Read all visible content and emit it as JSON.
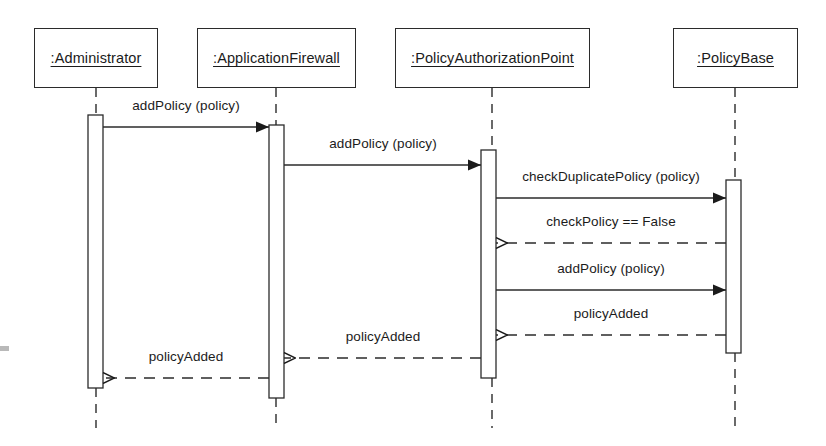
{
  "diagram": {
    "type": "uml-sequence-diagram",
    "width": 826,
    "height": 446,
    "background_color": "#ffffff",
    "line_color": "#2b2b2b",
    "text_color": "#1b1b1b"
  },
  "lifelines": [
    {
      "id": "administrator",
      "label": ":Administrator",
      "box": {
        "x": 34,
        "y": 28,
        "w": 124,
        "h": 60
      },
      "center_x": 96,
      "activation": {
        "x": 88,
        "y": 115,
        "w": 15,
        "h": 273
      },
      "lifeline_bottom": 428
    },
    {
      "id": "application-firewall",
      "label": ":ApplicationFirewall",
      "box": {
        "x": 197,
        "y": 28,
        "w": 159,
        "h": 60
      },
      "center_x": 276,
      "activation": {
        "x": 269,
        "y": 125,
        "w": 15,
        "h": 273
      },
      "lifeline_bottom": 428
    },
    {
      "id": "policy-authorization-point",
      "label": ":PolicyAuthorizationPoint",
      "box": {
        "x": 395,
        "y": 28,
        "w": 195,
        "h": 60
      },
      "center_x": 492,
      "activation": {
        "x": 481,
        "y": 150,
        "w": 15,
        "h": 228
      },
      "lifeline_bottom": 428
    },
    {
      "id": "policy-base",
      "label": ":PolicyBase",
      "box": {
        "x": 673,
        "y": 28,
        "w": 125,
        "h": 60
      },
      "center_x": 735,
      "activation": {
        "x": 726,
        "y": 180,
        "w": 15,
        "h": 173
      },
      "lifeline_bottom": 428
    }
  ],
  "messages": [
    {
      "id": "msg-1",
      "label": "addPolicy (policy)",
      "from": "administrator",
      "to": "application-firewall",
      "kind": "call",
      "style": "solid",
      "arrowhead": "filled",
      "direction": "right",
      "y": 127,
      "x1": 103,
      "x2": 269,
      "label_x": 186,
      "label_y": 112
    },
    {
      "id": "msg-2",
      "label": "addPolicy (policy)",
      "from": "application-firewall",
      "to": "policy-authorization-point",
      "kind": "call",
      "style": "solid",
      "arrowhead": "filled",
      "direction": "right",
      "y": 165,
      "x1": 284,
      "x2": 481,
      "label_x": 383,
      "label_y": 150
    },
    {
      "id": "msg-3",
      "label": "checkDuplicatePolicy (policy)",
      "from": "policy-authorization-point",
      "to": "policy-base",
      "kind": "call",
      "style": "solid",
      "arrowhead": "filled",
      "direction": "right",
      "y": 198,
      "x1": 496,
      "x2": 726,
      "label_x": 611,
      "label_y": 183
    },
    {
      "id": "msg-4",
      "label": "checkPolicy == False",
      "from": "policy-base",
      "to": "policy-authorization-point",
      "kind": "return",
      "style": "dashed",
      "arrowhead": "open",
      "direction": "left",
      "y": 243,
      "x1": 726,
      "x2": 496,
      "label_x": 611,
      "label_y": 228
    },
    {
      "id": "msg-5",
      "label": "addPolicy (policy)",
      "from": "policy-authorization-point",
      "to": "policy-base",
      "kind": "call",
      "style": "solid",
      "arrowhead": "filled",
      "direction": "right",
      "y": 290,
      "x1": 496,
      "x2": 726,
      "label_x": 611,
      "label_y": 275
    },
    {
      "id": "msg-6",
      "label": "policyAdded",
      "from": "policy-base",
      "to": "policy-authorization-point",
      "kind": "return",
      "style": "dashed",
      "arrowhead": "open",
      "direction": "left",
      "y": 335,
      "x1": 726,
      "x2": 496,
      "label_x": 611,
      "label_y": 320
    },
    {
      "id": "msg-7",
      "label": "policyAdded",
      "from": "policy-authorization-point",
      "to": "application-firewall",
      "kind": "return",
      "style": "dashed",
      "arrowhead": "open",
      "direction": "left",
      "y": 358,
      "x1": 481,
      "x2": 284,
      "label_x": 383,
      "label_y": 343
    },
    {
      "id": "msg-8",
      "label": "policyAdded",
      "from": "application-firewall",
      "to": "administrator",
      "kind": "return",
      "style": "dashed",
      "arrowhead": "open",
      "direction": "left",
      "y": 378,
      "x1": 269,
      "x2": 103,
      "label_x": 186,
      "label_y": 363
    }
  ]
}
